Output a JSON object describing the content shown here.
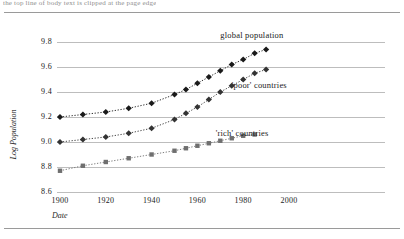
{
  "page": {
    "running_head": "the top line of body text is clipped at the page edge",
    "has_top_rule": true,
    "has_bottom_rule": true
  },
  "chart_data": {
    "type": "line",
    "title": "",
    "xlabel": "Date",
    "ylabel": "Log Population",
    "xlim": [
      1895,
      2005
    ],
    "ylim": [
      8.55,
      9.9
    ],
    "xticks": [
      1900,
      1920,
      1940,
      1960,
      1980,
      2000
    ],
    "yticks": [
      "9.8",
      "9.6",
      "9.4",
      "9.2",
      "9.0",
      "8.8",
      "8.6"
    ],
    "ytick_values": [
      9.8,
      9.6,
      9.4,
      9.2,
      9.0,
      8.8,
      8.6
    ],
    "grid": "horizontal",
    "legend": "inline-annotations",
    "series": [
      {
        "name": "global population",
        "marker": "diamond",
        "color": "#1a1a1a",
        "linestyle": "dotted",
        "label_x": 1970,
        "label_y": 9.86,
        "x": [
          1900,
          1910,
          1920,
          1930,
          1940,
          1950,
          1955,
          1960,
          1965,
          1970,
          1975,
          1980,
          1985,
          1990
        ],
        "values": [
          9.2,
          9.22,
          9.24,
          9.27,
          9.31,
          9.38,
          9.42,
          9.47,
          9.52,
          9.57,
          9.62,
          9.66,
          9.71,
          9.74
        ]
      },
      {
        "name": "'poor' countries",
        "marker": "diamond",
        "color": "#333333",
        "linestyle": "dotted",
        "label_x": 1975,
        "label_y": 9.46,
        "x": [
          1900,
          1910,
          1920,
          1930,
          1940,
          1950,
          1955,
          1960,
          1965,
          1970,
          1975,
          1980,
          1985,
          1990
        ],
        "values": [
          9.0,
          9.02,
          9.04,
          9.07,
          9.11,
          9.18,
          9.23,
          9.28,
          9.34,
          9.4,
          9.45,
          9.5,
          9.55,
          9.58
        ]
      },
      {
        "name": "'rich' countries",
        "marker": "square",
        "color": "#6f6f6f",
        "linestyle": "dotted",
        "label_x": 1968,
        "label_y": 9.07,
        "x": [
          1900,
          1910,
          1920,
          1930,
          1940,
          1950,
          1955,
          1960,
          1965,
          1970,
          1975,
          1980,
          1985
        ],
        "values": [
          8.77,
          8.81,
          8.84,
          8.87,
          8.9,
          8.93,
          8.95,
          8.97,
          8.99,
          9.01,
          9.03,
          9.05,
          9.06
        ]
      }
    ]
  }
}
